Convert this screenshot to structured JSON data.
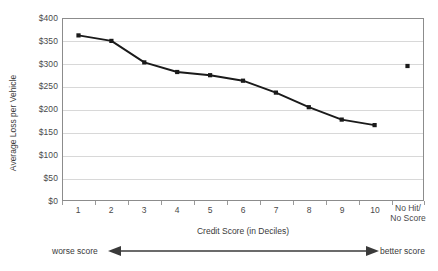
{
  "chart_data": {
    "type": "line",
    "title": "",
    "xlabel": "Credit Score (in Deciles)",
    "ylabel": "Average Loss per Vehicle",
    "categories": [
      "1",
      "2",
      "3",
      "4",
      "5",
      "6",
      "7",
      "8",
      "9",
      "10",
      "No Hit/\nNo Score"
    ],
    "category_labels": [
      {
        "line1": "1",
        "line2": ""
      },
      {
        "line1": "2",
        "line2": ""
      },
      {
        "line1": "3",
        "line2": ""
      },
      {
        "line1": "4",
        "line2": ""
      },
      {
        "line1": "5",
        "line2": ""
      },
      {
        "line1": "6",
        "line2": ""
      },
      {
        "line1": "7",
        "line2": ""
      },
      {
        "line1": "8",
        "line2": ""
      },
      {
        "line1": "9",
        "line2": ""
      },
      {
        "line1": "10",
        "line2": ""
      },
      {
        "line1": "No Hit/",
        "line2": "No Score"
      }
    ],
    "series": [
      {
        "name": "Average Loss per Vehicle",
        "values": [
          362,
          350,
          303,
          282,
          275,
          263,
          237,
          205,
          178,
          166,
          null
        ],
        "style": "line-with-markers",
        "color": "#1a1a1a"
      },
      {
        "name": "No Hit / No Score",
        "values": [
          null,
          null,
          null,
          null,
          null,
          null,
          null,
          null,
          null,
          null,
          295
        ],
        "style": "marker-only",
        "color": "#1a1a1a"
      }
    ],
    "ylim": [
      0,
      400
    ],
    "ytick_step": 50,
    "ytick_labels": [
      "$400",
      "$350",
      "$300",
      "$250",
      "$200",
      "$150",
      "$100",
      "$50",
      "$0"
    ],
    "ytick_values": [
      400,
      350,
      300,
      250,
      200,
      150,
      100,
      50,
      0
    ],
    "grid": true,
    "legend": "none",
    "annotations": {
      "left_label": "worse score",
      "right_label": "better score",
      "arrow": "double-headed-horizontal"
    },
    "colors": {
      "series": "#1a1a1a",
      "gridline": "#d8d8d8",
      "frame": "#8c8c8c",
      "text": "#3a3a3a",
      "arrow": "#3a3a3a"
    }
  }
}
